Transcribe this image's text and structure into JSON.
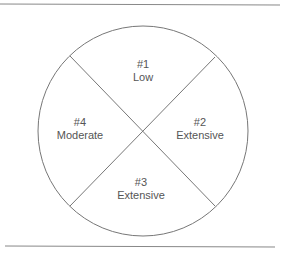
{
  "diagram": {
    "type": "quadrant-circle",
    "colors": {
      "stroke": "#777777",
      "text": "#555555",
      "rule": "#888888"
    },
    "quadrants": [
      {
        "position": "top",
        "number": "#1",
        "label": "Low"
      },
      {
        "position": "right",
        "number": "#2",
        "label": "Extensive"
      },
      {
        "position": "bottom",
        "number": "#3",
        "label": "Extensive"
      },
      {
        "position": "left",
        "number": "#4",
        "label": "Moderate"
      }
    ]
  }
}
